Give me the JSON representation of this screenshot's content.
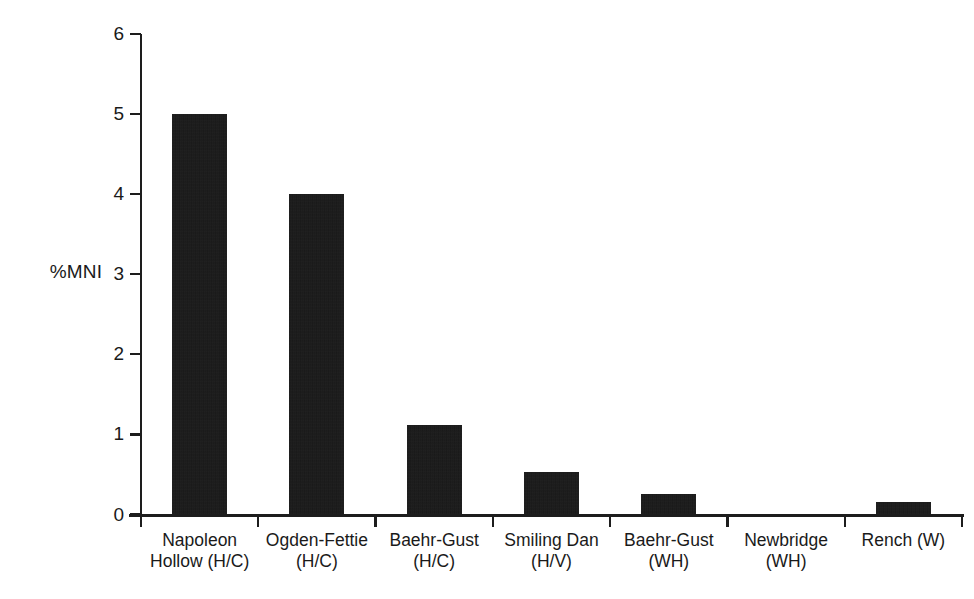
{
  "chart_data": {
    "type": "bar",
    "title": "",
    "subtitle": "",
    "xlabel": "",
    "ylabel": "%MNI",
    "ylim": [
      0,
      6
    ],
    "yticks": [
      0,
      1,
      2,
      3,
      4,
      5,
      6
    ],
    "ytick_labels": [
      "0",
      "1",
      "2",
      "3",
      "4",
      "5",
      "6"
    ],
    "grid": false,
    "legend": null,
    "bar_color": "#141414",
    "background_color": "#ffffff",
    "axis_color": "#1d1d1d",
    "categories": [
      "Napoleon Hollow (H/C)",
      "Ogden-Fettie (H/C)",
      "Baehr-Gust (H/C)",
      "Smiling Dan (H/V)",
      "Baehr-Gust (WH)",
      "Newbridge (WH)",
      "Rench (W)"
    ],
    "category_labels_wrapped": [
      "Napoleon\nHollow (H/C)",
      "Ogden-Fettie\n(H/C)",
      "Baehr-Gust\n(H/C)",
      "Smiling Dan\n(H/V)",
      "Baehr-Gust\n(WH)",
      "Newbridge\n(WH)",
      "Rench (W)"
    ],
    "values": [
      5.0,
      4.0,
      1.12,
      0.53,
      0.25,
      0.0,
      0.16
    ]
  }
}
